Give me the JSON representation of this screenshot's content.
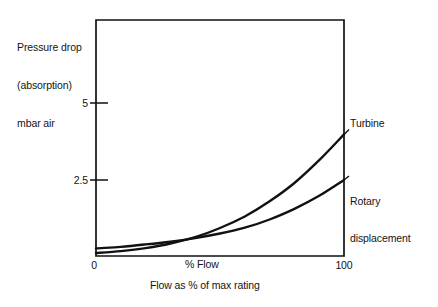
{
  "chart_data": {
    "type": "line",
    "title": "",
    "ylabel": "Pressure drop (absorption) mbar air",
    "ylabel_lines": [
      "Pressure drop",
      "(absorption)",
      "mbar air"
    ],
    "xlabel": "Flow as % of max rating",
    "x_inner_label": "% Flow",
    "x_ticks": [
      "0",
      "100"
    ],
    "xlim": [
      0,
      100
    ],
    "y_ticks": [
      "2.5",
      "5"
    ],
    "ylim": [
      0,
      7.5
    ],
    "grid": false,
    "legend_position": "right-inline",
    "series": [
      {
        "name": "Turbine",
        "label_lines": [
          "Turbine"
        ],
        "x": [
          0,
          10,
          20,
          30,
          40,
          50,
          60,
          70,
          80,
          90,
          100
        ],
        "values": [
          0.1,
          0.16,
          0.26,
          0.41,
          0.62,
          0.92,
          1.3,
          1.8,
          2.4,
          3.15,
          4.0
        ]
      },
      {
        "name": "Rotary displacement",
        "label_lines": [
          "Rotary",
          "displacement"
        ],
        "x": [
          0,
          10,
          20,
          30,
          40,
          50,
          60,
          70,
          80,
          90,
          100
        ],
        "values": [
          0.25,
          0.3,
          0.38,
          0.47,
          0.59,
          0.74,
          0.93,
          1.2,
          1.55,
          1.98,
          2.5
        ]
      }
    ],
    "colors": {
      "axis": "#111111",
      "curve": "#111111",
      "background": "#ffffff",
      "text": "#141414"
    }
  }
}
